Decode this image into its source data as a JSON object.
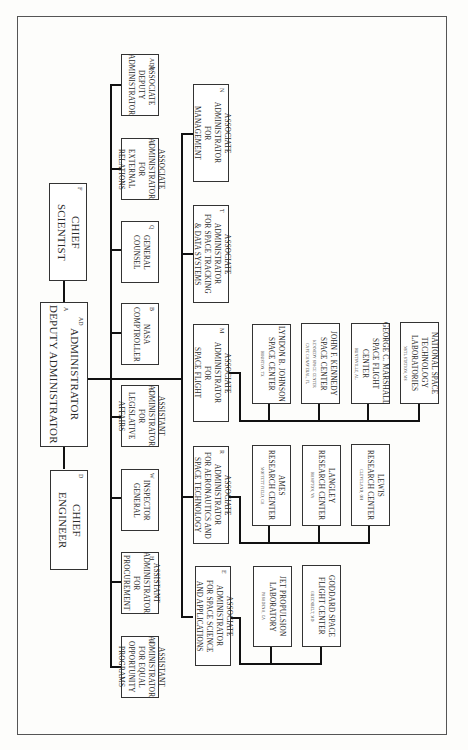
{
  "chart": {
    "title": "",
    "orientation": "rotated 90 degrees clockwise",
    "top_level": {
      "code": "A",
      "code2": "AD",
      "lines": [
        "ADMINISTRATOR",
        "DEPUTY ADMINISTRATOR"
      ]
    },
    "chief_scientist": {
      "code": "F",
      "lines": [
        "CHIEF",
        "SCIENTIST"
      ]
    },
    "chief_engineer": {
      "code": "D",
      "lines": [
        "CHIEF",
        "ENGINEER"
      ]
    },
    "staff_offices": [
      {
        "code": "ADB",
        "lines": [
          "ASSOCIATE",
          "DEPUTY",
          "ADMINISTRATOR"
        ]
      },
      {
        "code": "L",
        "lines": [
          "ASSOCIATE",
          "ADMINISTRATOR",
          "FOR",
          "EXTERNAL",
          "RELATIONS"
        ]
      },
      {
        "code": "Q",
        "lines": [
          "GENERAL",
          "COUNSEL"
        ]
      },
      {
        "code": "B",
        "lines": [
          "NASA",
          "COMPTROLLER"
        ]
      },
      {
        "code": "C",
        "lines": [
          "ASSISTANT",
          "ADMINISTRATOR",
          "FOR",
          "LEGISLATIVE",
          "AFFAIRS"
        ]
      },
      {
        "code": "W",
        "lines": [
          "INSPECTOR",
          "GENERAL"
        ]
      },
      {
        "code": "H",
        "lines": [
          "ASSISTANT",
          "ADMINISTRATOR",
          "FOR",
          "PROCUREMENT"
        ]
      },
      {
        "code": "U",
        "lines": [
          "ASSISTANT",
          "ADMINISTRATOR",
          "FOR EQUAL",
          "OPPORTUNITY",
          "PROGRAMS"
        ]
      }
    ],
    "program_offices": [
      {
        "code": "N",
        "lines": [
          "ASSOCIATE",
          "ADMINISTRATOR",
          "FOR",
          "MANAGEMENT"
        ]
      },
      {
        "code": "T",
        "lines": [
          "ASSOCIATE",
          "ADMINISTRATOR",
          "FOR SPACE TRACKING",
          "& DATA SYSTEMS"
        ]
      },
      {
        "code": "M",
        "lines": [
          "ASSOCIATE",
          "ADMINISTRATOR",
          "FOR",
          "SPACE FLIGHT"
        ]
      },
      {
        "code": "R",
        "lines": [
          "ASSOCIATE",
          "ADMINISTRATOR",
          "FOR AERONAUTICS AND",
          "SPACE TECHNOLOGY"
        ]
      },
      {
        "code": "E",
        "lines": [
          "ASSOCIATE",
          "ADMINISTRATOR",
          "FOR SPACE SCIENCE",
          "AND APPLICATIONS"
        ]
      }
    ],
    "centers_space_flight": [
      {
        "lines": [
          "LYNDON B. JOHNSON",
          "SPACE CENTER"
        ],
        "location": "HOUSTON, TX"
      },
      {
        "lines": [
          "JOHN F. KENNEDY",
          "SPACE CENTER",
          "KENNEDY SPACE CENTER"
        ],
        "location": "CAPE CANAVERAL, FL"
      },
      {
        "lines": [
          "GEORGE C. MARSHALL",
          "SPACE FLIGHT",
          "CENTER"
        ],
        "location": "HUNTSVILLE, AL"
      },
      {
        "lines": [
          "NATIONAL SPACE",
          "TECHNOLOGY",
          "LABORATORIES"
        ],
        "location": "NSTL STATION, MS"
      }
    ],
    "centers_aeronautics": [
      {
        "lines": [
          "AMES",
          "RESEARCH CENTER"
        ],
        "location": "MOFFETT FIELD, CA"
      },
      {
        "lines": [
          "LANGLEY",
          "RESEARCH CENTER"
        ],
        "location": "HAMPTON, VA"
      },
      {
        "lines": [
          "LEWIS",
          "RESEARCH CENTER"
        ],
        "location": "CLEVELAND, OH"
      }
    ],
    "centers_space_science": [
      {
        "lines": [
          "JET PROPULSION",
          "LABORATORY"
        ],
        "location": "PASADENA, CA"
      },
      {
        "lines": [
          "GODDARD SPACE",
          "FLIGHT CENTER"
        ],
        "location": "GREENBELT, MD"
      }
    ]
  }
}
